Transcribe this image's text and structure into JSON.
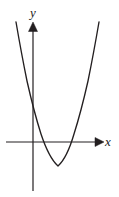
{
  "figure": {
    "kind": "coordinate-plane-graph",
    "background_color": "#ffffff",
    "stroke_color": "#231f20",
    "width": 119,
    "height": 197
  },
  "axes": {
    "x_axis": {
      "label": "x",
      "arrow": "right",
      "y_pixel": 142,
      "start_x_pixel": 6,
      "end_x_pixel": 103
    },
    "y_axis": {
      "label": "y",
      "arrow": "up",
      "x_pixel": 33,
      "start_y_pixel": 23,
      "end_y_pixel": 191
    }
  },
  "chart_data": {
    "type": "line",
    "title": "",
    "xlabel": "x",
    "ylabel": "y",
    "grid": false,
    "legend": false,
    "curve_name": "parabola",
    "orientation": "opens-upward",
    "vertex": {
      "x_pixel": 58,
      "y_pixel": 166
    },
    "x_intercepts_pixel": [
      38,
      77
    ],
    "y_intercept_pixel": 120,
    "left_branch_top": {
      "x_pixel": 16,
      "y_pixel": 22
    },
    "right_branch_top": {
      "x_pixel": 99,
      "y_pixel": 22
    },
    "x": [
      16,
      22,
      28,
      34,
      40,
      46,
      52,
      58,
      64,
      70,
      76,
      82,
      88,
      93,
      99
    ],
    "y": [
      22,
      58,
      89,
      114,
      133,
      148,
      160,
      166,
      164,
      155,
      141,
      120,
      92,
      60,
      22
    ]
  },
  "svg_paths": {
    "parabola": "M 16 22 Q 21.5 54 27 81 Q 34 112 41 134 Q 49 158 58 166 Q 67 158 74 134 Q 81 112 88 81 Q 93.5 54 99 22",
    "x_axis_line": "M 6 142 L 96 142",
    "y_axis_line": "M 33 191 L 33 30",
    "x_arrowhead": "M 95 137.5 L 104 142 L 95 146.5 Z",
    "y_arrowhead": "M 28.5 31 L 33 22 L 37.5 31 Z"
  }
}
